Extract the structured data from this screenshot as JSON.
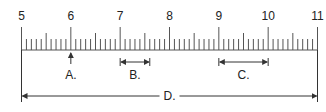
{
  "ruler": {
    "start": 5,
    "end": 11,
    "major_labels": [
      "5",
      "6",
      "7",
      "8",
      "9",
      "10",
      "11"
    ],
    "minor_divisions_per_unit": 10,
    "line_color": "#555555",
    "text_color": "#222222"
  },
  "markers": {
    "A": {
      "label": "A.",
      "type": "point",
      "value": 6.0
    },
    "B": {
      "label": "B.",
      "type": "span",
      "from": 7.0,
      "to": 7.6
    },
    "C": {
      "label": "C.",
      "type": "span",
      "from": 9.0,
      "to": 10.0
    },
    "D": {
      "label": "D.",
      "type": "span",
      "from": 5.0,
      "to": 11.0
    }
  }
}
